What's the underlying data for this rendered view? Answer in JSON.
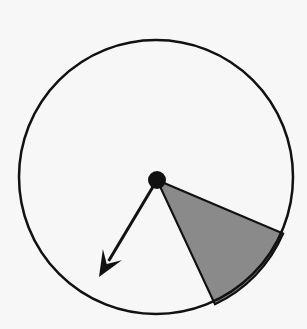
{
  "figure": {
    "background_color": "#f7f7f7",
    "width": 307,
    "height": 329,
    "ink_color": "#111111",
    "sector_fill_color": "#8a8a8a",
    "hub_color": "#111111"
  },
  "geometry": {
    "circle": {
      "label": "circle-outline",
      "center_x": 156,
      "center_y": 177,
      "radius": 137,
      "stroke_width": 2.5,
      "stroke_color": "#111111",
      "fill": "none"
    },
    "hub": {
      "label": "center-pivot-dot",
      "center_x": 157,
      "center_y": 180,
      "radius": 9,
      "fill_color": "#111111"
    },
    "sector": {
      "label": "shaded-sector",
      "apex_x": 157,
      "apex_y": 180,
      "start_angle_deg": 23,
      "end_angle_deg": 65,
      "sweep_deg": 42,
      "arc_start_x": 288,
      "arc_start_y": 238,
      "arc_end_x": 222,
      "arc_end_y": 307,
      "fill_color": "#8a8a8a",
      "stroke_color": "#111111",
      "stroke_width": 2.2
    },
    "vector": {
      "label": "radial-arrow",
      "tail_x": 157,
      "tail_y": 180,
      "tip_x": 99,
      "tip_y": 277,
      "angle_deg": 121,
      "length": 113,
      "stroke_width": 3,
      "stroke_color": "#111111",
      "head_length": 26,
      "head_half_width": 11
    }
  },
  "chart_data": {
    "type": "pie",
    "categories": [
      "shaded sector",
      "unshaded remainder"
    ],
    "values": [
      42,
      318
    ],
    "units": "degrees",
    "colors": [
      "#8a8a8a",
      "#f7f7f7"
    ],
    "annotations": [
      {
        "name": "radial-arrow",
        "kind": "vector",
        "angle_deg": 121,
        "length_px": 113,
        "description": "arrow from center pointing down-left"
      },
      {
        "name": "center-pivot-dot",
        "kind": "point",
        "description": "solid black dot at circle center"
      }
    ],
    "legend": "none",
    "grid": false,
    "xlabel": "",
    "ylabel": ""
  }
}
